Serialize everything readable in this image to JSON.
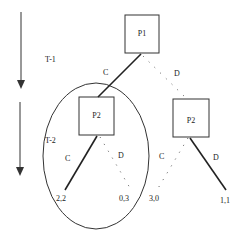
{
  "time_labels": [
    "T-1",
    "T-2"
  ],
  "nodes": {
    "root": "P1",
    "left": "P2",
    "right": "P2"
  },
  "edges": {
    "root_left": "C",
    "root_right": "D",
    "left_c": "C",
    "left_d": "D",
    "right_c": "C",
    "right_d": "D"
  },
  "payoffs": [
    "2,2",
    "0,3",
    "3,0",
    "1,1"
  ]
}
